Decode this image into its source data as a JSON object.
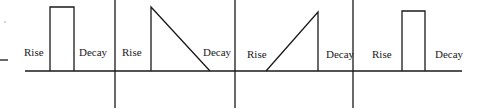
{
  "diagram": {
    "type": "envelope-shapes",
    "stroke_color": "#1a1a1a",
    "background": "#ffffff",
    "panels": [
      {
        "id": "panel-1",
        "shape": "rectangle",
        "rise_label": "Rise",
        "decay_label": "Decay"
      },
      {
        "id": "panel-2",
        "shape": "instant-rise-linear-decay",
        "rise_label": "Rise",
        "decay_label": "Decay"
      },
      {
        "id": "panel-3",
        "shape": "linear-rise-instant-decay",
        "rise_label": "Rise",
        "decay_label": "Decay"
      },
      {
        "id": "panel-4",
        "shape": "rectangle",
        "rise_label": "Rise",
        "decay_label": "Decay"
      }
    ]
  }
}
